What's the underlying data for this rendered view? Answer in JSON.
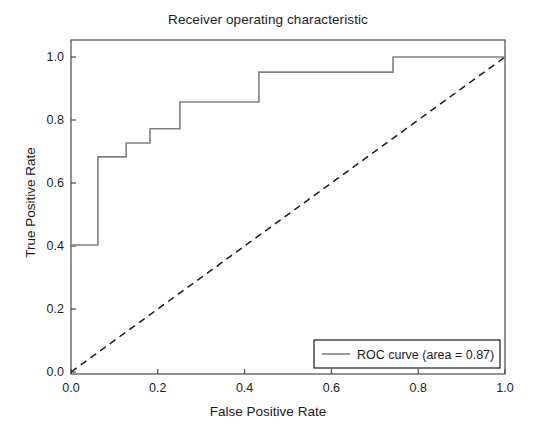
{
  "chart_data": {
    "type": "line",
    "title": "Receiver operating characteristic",
    "xlabel": "False Positive Rate",
    "ylabel": "True Positive Rate",
    "xlim": [
      0.0,
      1.0
    ],
    "ylim": [
      0.0,
      1.05
    ],
    "grid": false,
    "legend_position": "lower right",
    "xticks": [
      "0.0",
      "0.2",
      "0.4",
      "0.6",
      "0.8",
      "1.0"
    ],
    "xtick_values": [
      0.0,
      0.2,
      0.4,
      0.6,
      0.8,
      1.0
    ],
    "yticks": [
      "0.0",
      "0.2",
      "0.4",
      "0.6",
      "0.8",
      "1.0"
    ],
    "ytick_values": [
      0.0,
      0.2,
      0.4,
      0.6,
      0.8,
      1.0
    ],
    "series": [
      {
        "name": "ROC curve (area = 0.87)",
        "style": "step-post",
        "color": "#808080",
        "linestyle": "solid",
        "x": [
          0.0,
          0.062,
          0.062,
          0.127,
          0.127,
          0.182,
          0.182,
          0.251,
          0.251,
          0.433,
          0.433,
          0.742,
          0.742,
          1.0
        ],
        "y": [
          0.403,
          0.403,
          0.683,
          0.683,
          0.727,
          0.727,
          0.772,
          0.772,
          0.857,
          0.857,
          0.952,
          0.952,
          1.0,
          1.0
        ]
      },
      {
        "name": "chance-diagonal",
        "style": "line",
        "color": "#1a1a1a",
        "linestyle": "dashed",
        "x": [
          0.0,
          1.0
        ],
        "y": [
          0.0,
          1.0
        ]
      }
    ],
    "annotations": {
      "auc": 0.87
    }
  },
  "legend": {
    "entries": [
      {
        "label": "ROC curve (area = 0.87)",
        "color": "#808080",
        "linestyle": "solid"
      }
    ]
  },
  "colors": {
    "roc_curve": "#808080",
    "diagonal": "#1a1a1a",
    "axis": "#4a4a4a",
    "text": "#1c1c1c",
    "background": "#ffffff"
  }
}
